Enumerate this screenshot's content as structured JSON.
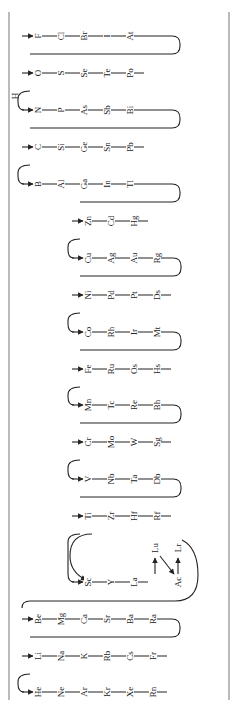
{
  "diagram": {
    "frame": {
      "left_x": 9,
      "right_x": 229,
      "top_y": 12,
      "bottom_y": 700
    },
    "colors": {
      "line": "#222222",
      "frame": "#777777",
      "background": "#ffffff"
    },
    "rows": [
      {
        "y": 36,
        "start_x": 22,
        "elements": [
          "F",
          "Cl",
          "Br",
          "I",
          "At"
        ],
        "turn": "right"
      },
      {
        "y": 73,
        "start_x": 22,
        "elements": [
          "O",
          "S",
          "Se",
          "Te",
          "Po"
        ],
        "turn": "left"
      },
      {
        "y": 110,
        "start_x": 22,
        "elements": [
          "N",
          "P",
          "As",
          "Sb",
          "Bi"
        ],
        "turn": "right",
        "branch_label": "H"
      },
      {
        "y": 147,
        "start_x": 22,
        "elements": [
          "C",
          "Si",
          "Ge",
          "Sn",
          "Pb"
        ],
        "turn": "left"
      },
      {
        "y": 184,
        "start_x": 22,
        "elements": [
          "B",
          "Al",
          "Ga",
          "In",
          "Tl"
        ],
        "turn": "right"
      },
      {
        "y": 221,
        "start_x": 72,
        "elements": [
          "Zn",
          "Cd",
          "Hg"
        ],
        "turn": "left"
      },
      {
        "y": 258,
        "start_x": 72,
        "elements": [
          "Cu",
          "Ag",
          "Au",
          "Rg"
        ],
        "turn": "right"
      },
      {
        "y": 295,
        "start_x": 72,
        "elements": [
          "Ni",
          "Pd",
          "Pt",
          "Ds"
        ],
        "turn": "left"
      },
      {
        "y": 332,
        "start_x": 72,
        "elements": [
          "Co",
          "Rh",
          "Ir",
          "Mt"
        ],
        "turn": "right"
      },
      {
        "y": 369,
        "start_x": 72,
        "elements": [
          "Fe",
          "Ru",
          "Os",
          "Hs"
        ],
        "turn": "left"
      },
      {
        "y": 405,
        "start_x": 72,
        "elements": [
          "Mn",
          "Tc",
          "Re",
          "Bh"
        ],
        "turn": "right"
      },
      {
        "y": 442,
        "start_x": 72,
        "elements": [
          "Cr",
          "Mo",
          "W",
          "Sg"
        ],
        "turn": "left"
      },
      {
        "y": 479,
        "start_x": 72,
        "elements": [
          "V",
          "Nb",
          "Ta",
          "Db"
        ],
        "turn": "right"
      },
      {
        "y": 516,
        "start_x": 72,
        "elements": [
          "Ti",
          "Zr",
          "Hf",
          "Rf"
        ],
        "turn": "left"
      },
      {
        "y": 582,
        "start_x": 72,
        "elements": [
          "Sc",
          "Y",
          "La"
        ],
        "turn": "none"
      },
      {
        "y": 619,
        "start_x": 22,
        "elements": [
          "Be",
          "Mg",
          "Ca",
          "Sr",
          "Ba",
          "Ra"
        ],
        "turn": "right"
      },
      {
        "y": 656,
        "start_x": 22,
        "elements": [
          "Li",
          "Na",
          "K",
          "Rb",
          "Cs",
          "Fr"
        ],
        "turn": "left"
      },
      {
        "y": 692,
        "start_x": 22,
        "elements": [
          "He",
          "Ne",
          "Ar",
          "Kr",
          "Xe",
          "Rn"
        ],
        "turn": "end"
      }
    ],
    "f_block_links": {
      "Lu": {
        "x": 155,
        "y": 548
      },
      "Lr": {
        "x": 178,
        "y": 548
      },
      "Ac": {
        "x": 178,
        "y": 582
      }
    }
  }
}
